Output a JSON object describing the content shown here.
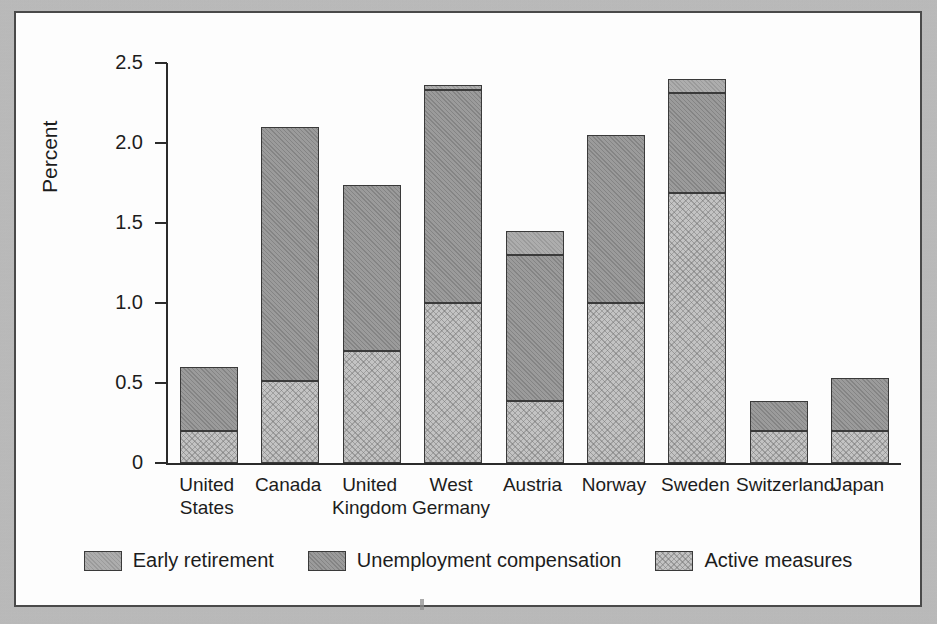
{
  "figure": {
    "background_color": "#fdfdfd",
    "frame_color": "#4a4a4a",
    "page_color": "#bcbcbc"
  },
  "chart_data": {
    "type": "bar",
    "stacked": true,
    "title": "",
    "subtitle": "",
    "xlabel": "",
    "ylabel": "Percent",
    "ylim": [
      0,
      2.5
    ],
    "yticks": [
      0,
      0.5,
      1.0,
      1.5,
      2.0,
      2.5
    ],
    "ytick_labels": [
      "0",
      "0.5",
      "1.0",
      "1.5",
      "2.0",
      "2.5"
    ],
    "grid": false,
    "legend_position": "bottom",
    "categories": [
      "United States",
      "Canada",
      "United Kingdom",
      "West Germany",
      "Austria",
      "Norway",
      "Sweden",
      "Switzerland",
      "Japan"
    ],
    "category_lines": [
      [
        "United",
        "States"
      ],
      [
        "Canada"
      ],
      [
        "United",
        "Kingdom"
      ],
      [
        "West",
        "Germany"
      ],
      [
        "Austria"
      ],
      [
        "Norway"
      ],
      [
        "Sweden"
      ],
      [
        "Switzerland"
      ],
      [
        "Japan"
      ]
    ],
    "series": [
      {
        "name": "Active measures",
        "fill": "light-hatched",
        "color": "#c3c3c3",
        "values": [
          0.2,
          0.51,
          0.7,
          1.0,
          0.39,
          1.0,
          1.69,
          0.2,
          0.2
        ]
      },
      {
        "name": "Unemployment compensation",
        "fill": "dark-gray",
        "color": "#9b9b9b",
        "values": [
          0.4,
          1.59,
          1.04,
          1.33,
          0.91,
          1.05,
          0.62,
          0.19,
          0.33
        ]
      },
      {
        "name": "Early retirement",
        "fill": "medium-gray",
        "color": "#adadad",
        "values": [
          0.0,
          0.0,
          0.0,
          0.03,
          0.15,
          0.0,
          0.09,
          0.0,
          0.0
        ]
      }
    ],
    "totals": [
      0.6,
      2.1,
      1.74,
      2.36,
      1.45,
      2.05,
      2.4,
      0.39,
      0.53
    ],
    "stack_order_bottom_to_top": [
      "Active measures",
      "Unemployment compensation",
      "Early retirement"
    ]
  },
  "legend": {
    "items": [
      {
        "label": "Early retirement",
        "swatch": "medium-gray"
      },
      {
        "label": "Unemployment compensation",
        "swatch": "dark-gray"
      },
      {
        "label": "Active measures",
        "swatch": "light-hatched"
      }
    ]
  }
}
